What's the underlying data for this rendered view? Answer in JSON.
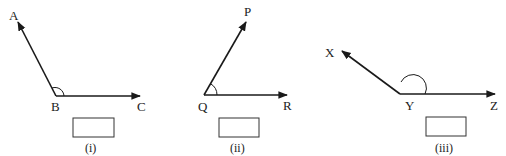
{
  "figures": [
    {
      "id": "i",
      "caption": "(i)",
      "vertex": {
        "label": "B",
        "x": 56,
        "y": 96
      },
      "ray1": {
        "label": "A",
        "x": 18,
        "y": 22
      },
      "ray2": {
        "label": "C",
        "x": 140,
        "y": 96
      },
      "angle_type_shown": "obtuse",
      "answer_box": ""
    },
    {
      "id": "ii",
      "caption": "(ii)",
      "vertex": {
        "label": "Q",
        "x": 204,
        "y": 95
      },
      "ray1": {
        "label": "P",
        "x": 246,
        "y": 20
      },
      "ray2": {
        "label": "R",
        "x": 287,
        "y": 95
      },
      "angle_type_shown": "acute",
      "answer_box": ""
    },
    {
      "id": "iii",
      "caption": "(iii)",
      "vertex": {
        "label": "Y",
        "x": 400,
        "y": 94
      },
      "ray1": {
        "label": "X",
        "x": 340,
        "y": 50
      },
      "ray2": {
        "label": "Z",
        "x": 495,
        "y": 94
      },
      "angle_type_shown": "obtuse",
      "answer_box": ""
    }
  ]
}
